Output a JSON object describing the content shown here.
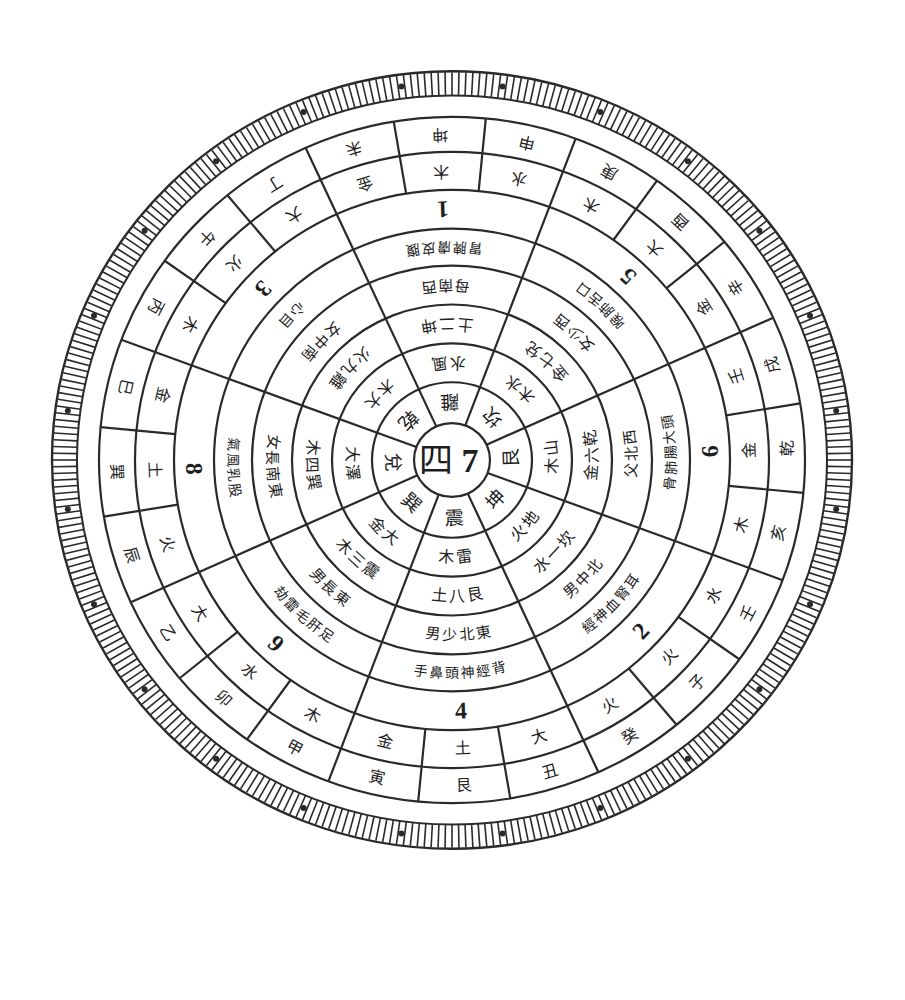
{
  "diagram": {
    "title": "",
    "center": {
      "x": 452,
      "y": 460,
      "sy": 0.972
    },
    "colors": {
      "ink": "#2a2a2a",
      "band": "#3a3a3a",
      "paper": "#ffffff"
    },
    "center_label": {
      "left": "四",
      "right": "7"
    },
    "radii": {
      "center": 38,
      "ring1": [
        38,
        80
      ],
      "ring2": [
        80,
        120
      ],
      "ring3": [
        120,
        160
      ],
      "ring4": [
        160,
        200
      ],
      "ring5": [
        200,
        238
      ],
      "ring6": [
        238,
        278
      ],
      "ring7": [
        278,
        317
      ],
      "ring8": [
        317,
        353
      ],
      "band": [
        353,
        375
      ],
      "ticks": [
        375,
        400
      ]
    },
    "rings": [
      {
        "name": "trigram-ring",
        "r": 59,
        "size": 19,
        "sectors": 8,
        "offset": 0,
        "cells": [
          "離",
          "坎",
          "艮",
          "坤",
          "震",
          "巽",
          "兌",
          "乾"
        ]
      },
      {
        "name": "element-ring",
        "r": 100,
        "size": 16,
        "sectors": 8,
        "offset": 0,
        "cells": [
          "風水",
          "水木",
          "山木",
          "地火",
          "雷木",
          "大金",
          "澤大",
          "大木"
        ]
      },
      {
        "name": "number-ring",
        "r": 140,
        "size": 16,
        "sectors": 8,
        "offset": 0,
        "cells": [
          "坤二土",
          "兌七金",
          "乾六金",
          "坎一水",
          "艮八土",
          "震三木",
          "巽四木",
          "離九火"
        ]
      },
      {
        "name": "family-ring",
        "r": 180,
        "size": 15,
        "sectors": 8,
        "offset": 0,
        "cells": [
          "西南母",
          "西少女",
          "西北父",
          "北中男",
          "東北少男",
          "東長男",
          "東南長女",
          "南中女"
        ]
      },
      {
        "name": "body-ring",
        "r": 219,
        "size": 14,
        "sectors": 8,
        "offset": 0,
        "cells": [
          "腹皮膚脾胃",
          "口舌肺喉",
          "頭大腸肺骨",
          "耳腎血神經",
          "背經神頭鼻手",
          "足肝毛雷劫",
          "股乳風氣",
          "目心"
        ]
      },
      {
        "name": "star-number-ring",
        "r": 258,
        "size": 24,
        "sectors": 8,
        "offset": 0,
        "cells": [
          "1",
          "5",
          "6",
          "2",
          "4",
          "9",
          "8",
          "3"
        ]
      },
      {
        "name": "mountain-element-ring",
        "r": 297,
        "size": 16,
        "sectors": 24,
        "offset": 0,
        "cells": [
          "木",
          "水",
          "木",
          "大",
          "金",
          "壬",
          "金",
          "木",
          "水",
          "火",
          "火",
          "大",
          "土",
          "金",
          "木",
          "水",
          "大",
          "火",
          "土",
          "金",
          "木",
          "火",
          "大",
          "金"
        ]
      },
      {
        "name": "twenty-four-mountains-ring",
        "r": 335,
        "size": 16,
        "sectors": 24,
        "offset": 0,
        "cells": [
          "坤",
          "申",
          "庚",
          "酉",
          "辛",
          "戌",
          "乾",
          "亥",
          "壬",
          "子",
          "癸",
          "丑",
          "艮",
          "寅",
          "甲",
          "卯",
          "乙",
          "辰",
          "巽",
          "巳",
          "丙",
          "午",
          "丁",
          "未"
        ]
      }
    ],
    "ring7_labels": {
      "note": "period numerals visible in ring 238-278 sub-cells",
      "cells": [
        "一",
        "伍",
        "六",
        "貳",
        "陸",
        "肆",
        "七",
        "捌",
        "二",
        "玖",
        "三",
        "八",
        "丁",
        "五",
        "九"
      ]
    },
    "band_pattern": [
      1,
      0,
      1,
      1,
      0,
      1,
      1,
      0,
      1,
      1,
      0,
      1,
      1,
      0,
      1,
      1,
      0,
      1,
      1,
      0,
      1,
      1,
      0,
      1
    ],
    "tick_count": 360
  }
}
